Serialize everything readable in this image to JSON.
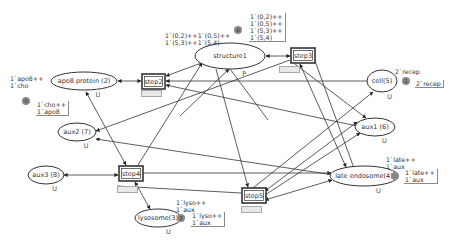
{
  "diagram": {
    "type": "colored-petri-net",
    "colors": {
      "stroke": "#333333",
      "background": "#ffffff",
      "token_badge": "#8a8a8a",
      "tag_fill": "#e8e8e8"
    }
  },
  "places": [
    {
      "id": "apo8",
      "name": "apo8 protein (2)",
      "type": "U",
      "cx": 84,
      "cy": 81,
      "rx": 33,
      "ry": 9,
      "initial_marking": "1`apo8++\n1`cho",
      "initial_pos": [
        10,
        75
      ],
      "current_marking": "1`cho++\n1`apo8",
      "current_pos": [
        36,
        101
      ],
      "token_count": "8",
      "badge_pos": [
        26,
        101
      ]
    },
    {
      "id": "structure1",
      "name": "structure1",
      "type": "P",
      "cx": 230,
      "cy": 56,
      "rx": 35,
      "ry": 13,
      "initial_marking": "1`(0,2)++1`(0,5)++\n1`(5,3)++1`(5,4)",
      "initial_pos": [
        165,
        32
      ],
      "current_marking": "1`(0,2)++\n1`(0,5)++\n1`(5,3)++\n1`(5,4)",
      "current_pos": [
        249,
        13
      ],
      "token_count": "8",
      "badge_pos": [
        238,
        30
      ]
    },
    {
      "id": "cell",
      "name": "cell(5)",
      "type": "U",
      "cx": 382,
      "cy": 81,
      "rx": 15,
      "ry": 11,
      "initial_marking": "2`recep",
      "initial_pos": [
        395,
        68
      ],
      "current_marking": "2`recep",
      "current_pos": [
        415,
        80
      ],
      "token_count": "2",
      "badge_pos": [
        406,
        81
      ]
    },
    {
      "id": "aux2",
      "name": "aux2 (7)",
      "type": "U",
      "cx": 77,
      "cy": 132,
      "rx": 19,
      "ry": 9
    },
    {
      "id": "aux1",
      "name": "aux1 (6)",
      "type": "U",
      "cx": 375,
      "cy": 127,
      "rx": 20,
      "ry": 9
    },
    {
      "id": "aux3",
      "name": "aux3 (8)",
      "type": "U",
      "cx": 46,
      "cy": 175,
      "rx": 18,
      "ry": 9
    },
    {
      "id": "late_endosome",
      "name": "late endosome(4)",
      "type": "U",
      "cx": 364,
      "cy": 176,
      "rx": 34,
      "ry": 10,
      "initial_marking": "1`late++\n1`aux",
      "initial_pos": [
        386,
        156
      ],
      "current_marking": "1`late++\n1`aux",
      "current_pos": [
        404,
        169
      ],
      "token_count": "",
      "badge_pos": [
        395,
        176
      ]
    },
    {
      "id": "lysosome",
      "name": "lysosome(3)",
      "type": "U",
      "cx": 158,
      "cy": 218,
      "rx": 23,
      "ry": 9,
      "initial_marking": "1`lyso++\n1`aux",
      "initial_pos": [
        176,
        199
      ],
      "current_marking": "1`lyso++\n1`aux",
      "current_pos": [
        191,
        212
      ],
      "token_count": "2",
      "badge_pos": [
        181,
        218
      ]
    }
  ],
  "transitions": [
    {
      "id": "step2",
      "name": "step2",
      "x": 142,
      "y": 74,
      "w": 23,
      "h": 15,
      "tag_pos": [
        141,
        90
      ]
    },
    {
      "id": "step3",
      "name": "step3",
      "x": 291,
      "y": 48,
      "w": 24,
      "h": 15,
      "tag_pos": [
        279,
        66
      ]
    },
    {
      "id": "step4",
      "name": "step4",
      "x": 119,
      "y": 166,
      "w": 24,
      "h": 15,
      "tag_pos": [
        117,
        186
      ]
    },
    {
      "id": "step5",
      "name": "step5",
      "x": 242,
      "y": 188,
      "w": 24,
      "h": 15,
      "tag_pos": [
        241,
        206
      ]
    }
  ],
  "arcs": [
    {
      "from": [
        118,
        81
      ],
      "to": [
        141,
        81
      ],
      "head": "both"
    },
    {
      "from": [
        166,
        76
      ],
      "to": [
        204,
        62
      ],
      "head": "both"
    },
    {
      "from": [
        266,
        56
      ],
      "to": [
        290,
        56
      ],
      "head": "both"
    },
    {
      "from": [
        166,
        81
      ],
      "to": [
        367,
        81
      ],
      "head": "start"
    },
    {
      "from": [
        166,
        85
      ],
      "to": [
        357,
        126
      ],
      "head": "start"
    },
    {
      "from": [
        290,
        60
      ],
      "to": [
        96,
        131
      ],
      "head": "end"
    },
    {
      "from": [
        86,
        92
      ],
      "to": [
        126,
        165
      ],
      "head": "both"
    },
    {
      "from": [
        138,
        165
      ],
      "to": [
        202,
        63
      ],
      "head": "end"
    },
    {
      "from": [
        216,
        69
      ],
      "to": [
        248,
        187
      ],
      "head": "end"
    },
    {
      "from": [
        229,
        69
      ],
      "to": [
        180,
        116
      ],
      "head": "start"
    },
    {
      "from": [
        268,
        120
      ],
      "to": [
        230,
        69
      ],
      "head": "none"
    },
    {
      "from": [
        96,
        139
      ],
      "to": [
        334,
        175
      ],
      "head": "start"
    },
    {
      "from": [
        64,
        175
      ],
      "to": [
        118,
        175
      ],
      "head": "both"
    },
    {
      "from": [
        143,
        173
      ],
      "to": [
        331,
        173
      ],
      "head": "end"
    },
    {
      "from": [
        135,
        182
      ],
      "to": [
        150,
        209
      ],
      "head": "both"
    },
    {
      "from": [
        117,
        186
      ],
      "to": [
        241,
        193
      ],
      "head": "none"
    },
    {
      "from": [
        265,
        191
      ],
      "to": [
        357,
        122
      ],
      "head": "both"
    },
    {
      "from": [
        265,
        195
      ],
      "to": [
        360,
        133
      ],
      "head": "end"
    },
    {
      "from": [
        265,
        200
      ],
      "to": [
        332,
        180
      ],
      "head": "both"
    },
    {
      "from": [
        253,
        188
      ],
      "to": [
        373,
        92
      ],
      "head": "end"
    },
    {
      "from": [
        295,
        64
      ],
      "to": [
        366,
        118
      ],
      "head": "end"
    },
    {
      "from": [
        300,
        64
      ],
      "to": [
        346,
        167
      ],
      "head": "both"
    },
    {
      "from": [
        315,
        61
      ],
      "to": [
        355,
        171
      ],
      "head": "none"
    }
  ]
}
